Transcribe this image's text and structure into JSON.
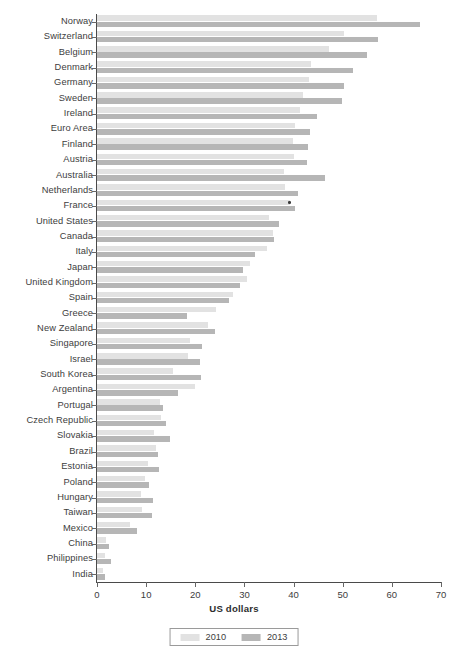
{
  "chart_data": {
    "type": "bar",
    "orientation": "horizontal",
    "title": "",
    "subtitle": "",
    "xlabel": "US dollars",
    "ylabel": "",
    "xlim": [
      0,
      70
    ],
    "xticks": [
      0,
      10,
      20,
      30,
      40,
      50,
      60,
      70
    ],
    "grid": false,
    "legend_position": "bottom",
    "categories": [
      "Norway",
      "Switzerland",
      "Belgium",
      "Denmark",
      "Germany",
      "Sweden",
      "Ireland",
      "Euro Area",
      "Finland",
      "Austria",
      "Australia",
      "Netherlands",
      "France",
      "United States",
      "Canada",
      "Italy",
      "Japan",
      "United Kingdom",
      "Spain",
      "Greece",
      "New Zealand",
      "Singapore",
      "Israel",
      "South Korea",
      "Argentina",
      "Portugal",
      "Czech Republic",
      "Slovakia",
      "Brazil",
      "Estonia",
      "Poland",
      "Hungary",
      "Taiwan",
      "Mexico",
      "China",
      "Philippines",
      "India"
    ],
    "series": [
      {
        "name": "2010",
        "color": "#e2e2e2",
        "values": [
          57.0,
          50.3,
          47.2,
          43.6,
          43.2,
          41.9,
          41.3,
          40.2,
          39.9,
          40.0,
          38.1,
          38.3,
          39.2,
          35.1,
          35.8,
          34.6,
          31.2,
          30.5,
          27.7,
          24.3,
          22.6,
          19.0,
          18.5,
          15.5,
          19.9,
          12.8,
          13.1,
          11.6,
          12.0,
          10.3,
          9.8,
          8.9,
          9.1,
          6.7,
          1.8,
          1.6,
          1.2
        ]
      },
      {
        "name": "2013",
        "color": "#b6b6b6",
        "values": [
          65.7,
          57.2,
          54.9,
          52.1,
          50.2,
          49.9,
          44.7,
          43.4,
          43.0,
          42.7,
          46.4,
          41.0,
          40.2,
          37.0,
          36.1,
          32.2,
          29.7,
          29.1,
          26.8,
          18.4,
          24.0,
          21.3,
          21.0,
          21.2,
          16.5,
          13.5,
          14.1,
          14.8,
          12.4,
          12.7,
          10.6,
          11.3,
          11.2,
          8.2,
          2.4,
          2.8,
          1.6
        ]
      }
    ],
    "annotations": [
      {
        "label": "marker-dot",
        "category": "France",
        "series": "2010",
        "x": 39.2,
        "color": "#3a3a3a"
      }
    ]
  },
  "legend": {
    "items": [
      {
        "label": "2010",
        "color": "#e2e2e2"
      },
      {
        "label": "2013",
        "color": "#b6b6b6"
      }
    ]
  },
  "axis": {
    "x_title": "US dollars"
  }
}
